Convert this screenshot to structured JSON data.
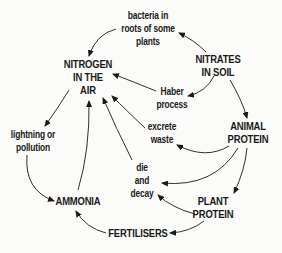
{
  "diagram": {
    "nodes": {
      "nitrogen_air": {
        "lines": [
          "NITROGEN",
          "IN THE",
          "AIR"
        ]
      },
      "nitrates_soil": {
        "lines": [
          "NITRATES",
          "IN SOIL"
        ]
      },
      "animal_protein": {
        "lines": [
          "ANIMAL",
          "PROTEIN"
        ]
      },
      "plant_protein": {
        "lines": [
          "PLANT",
          "PROTEIN"
        ]
      },
      "ammonia": {
        "lines": [
          "AMMONIA"
        ]
      },
      "fertilisers": {
        "lines": [
          "FERTILISERS"
        ]
      }
    },
    "processes": {
      "bacteria": {
        "lines": [
          "bacteria in",
          "roots of some",
          "plants"
        ]
      },
      "haber": {
        "lines": [
          "Haber",
          "process"
        ]
      },
      "excrete": {
        "lines": [
          "excrete",
          "waste"
        ]
      },
      "decay": {
        "lines": [
          "die",
          "and",
          "decay"
        ]
      },
      "lightning": {
        "lines": [
          "lightning or",
          "pollution"
        ]
      }
    },
    "edges": [
      {
        "from": "NITRATES IN SOIL",
        "to": "bacteria in roots of some plants"
      },
      {
        "from": "bacteria in roots of some plants",
        "to": "NITROGEN IN THE AIR"
      },
      {
        "from": "NITRATES IN SOIL",
        "to": "Haber process"
      },
      {
        "from": "Haber process",
        "to": "NITROGEN IN THE AIR"
      },
      {
        "from": "NITRATES IN SOIL",
        "to": "ANIMAL PROTEIN"
      },
      {
        "from": "ANIMAL PROTEIN",
        "to": "excrete waste"
      },
      {
        "from": "excrete waste",
        "to": "NITROGEN IN THE AIR"
      },
      {
        "from": "ANIMAL PROTEIN",
        "to": "die and decay"
      },
      {
        "from": "ANIMAL PROTEIN",
        "to": "PLANT PROTEIN"
      },
      {
        "from": "PLANT PROTEIN",
        "to": "die and decay"
      },
      {
        "from": "die and decay",
        "to": "NITROGEN IN THE AIR"
      },
      {
        "from": "PLANT PROTEIN",
        "to": "FERTILISERS"
      },
      {
        "from": "FERTILISERS",
        "to": "AMMONIA"
      },
      {
        "from": "AMMONIA",
        "to": "NITROGEN IN THE AIR"
      },
      {
        "from": "NITROGEN IN THE AIR",
        "to": "lightning or pollution"
      },
      {
        "from": "lightning or pollution",
        "to": "AMMONIA"
      }
    ],
    "colors": {
      "ink": "#1a1a1a",
      "paper": "#fbfbf9"
    }
  }
}
